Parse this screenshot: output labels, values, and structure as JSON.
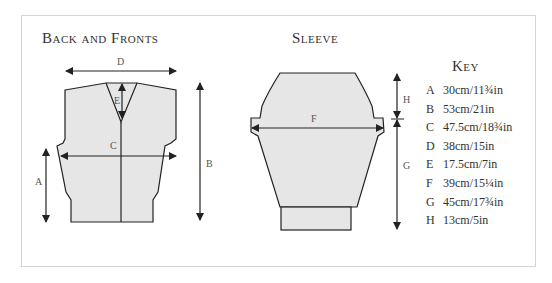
{
  "titles": {
    "back_and_fronts": "Back and Fronts",
    "sleeve": "Sleeve",
    "key": "Key"
  },
  "labels": {
    "A": "A",
    "B": "B",
    "C": "C",
    "D": "D",
    "E": "E",
    "F": "F",
    "G": "G",
    "H": "H"
  },
  "key": [
    {
      "letter": "A",
      "value": "30cm/11¾in"
    },
    {
      "letter": "B",
      "value": "53cm/21in"
    },
    {
      "letter": "C",
      "value": "47.5cm/18¾in"
    },
    {
      "letter": "D",
      "value": "38cm/15in"
    },
    {
      "letter": "E",
      "value": "17.5cm/7in"
    },
    {
      "letter": "F",
      "value": "39cm/15¼in"
    },
    {
      "letter": "G",
      "value": "45cm/17¾in"
    },
    {
      "letter": "H",
      "value": "13cm/5in"
    }
  ],
  "colors": {
    "fill": "#e6e6e6",
    "stroke": "#222222",
    "frame": "#d4d4d4"
  }
}
